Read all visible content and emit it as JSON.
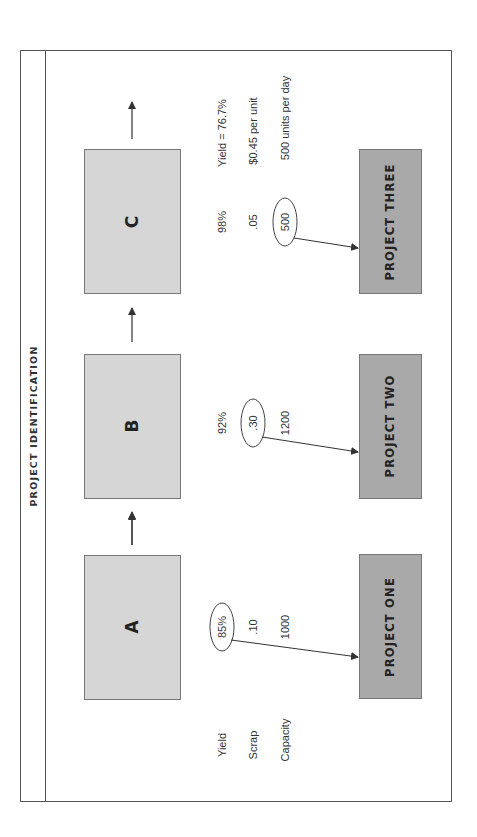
{
  "title": "PROJECT IDENTIFICATION",
  "row_labels": {
    "yield": "Yield",
    "scrap": "Scrap",
    "capacity": "Capacity"
  },
  "processes": [
    {
      "label": "A",
      "yield": "85%",
      "scrap": ".10",
      "capacity": "1000",
      "circled": "yield"
    },
    {
      "label": "B",
      "yield": "92%",
      "scrap": ".30",
      "capacity": "1200",
      "circled": "scrap"
    },
    {
      "label": "C",
      "yield": "98%",
      "scrap": ".05",
      "capacity": "500",
      "circled": "capacity"
    }
  ],
  "summary": {
    "yield": "Yield = 76.7%",
    "scrap": "$0.45 per unit",
    "capacity": "500 units per day"
  },
  "projects": [
    {
      "label": "PROJECT ONE"
    },
    {
      "label": "PROJECT TWO"
    },
    {
      "label": "PROJECT THREE"
    }
  ],
  "colors": {
    "process_fill": "#d6d6d6",
    "project_fill": "#a9a9a9",
    "border": "#555555",
    "line": "#333333"
  }
}
